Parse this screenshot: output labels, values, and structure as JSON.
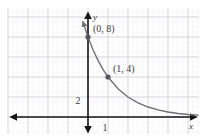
{
  "figure": {
    "name": "exponential-decay-graph",
    "background_color": "#ffffff",
    "grid": {
      "major_color": "#c8c8cf",
      "minor_color": "#e8e8ee",
      "major_spacing": 20,
      "minor_spacing": 5,
      "origin_x": 88,
      "origin_y": 117,
      "left": 8,
      "right": 199,
      "top": 8,
      "bottom": 134
    },
    "axes": {
      "color": "#161616",
      "x_axis_label": "x",
      "y_axis_label": "y",
      "x_axis_y": 117,
      "y_axis_x": 88,
      "arrowheads": "both"
    },
    "ticks": {
      "x": [
        {
          "label": "1",
          "value": 1
        }
      ],
      "y": [
        {
          "label": "2",
          "value": 2
        }
      ]
    },
    "curve": {
      "color": "#6e6e76",
      "width": 1.3,
      "arrow_at_top": true
    },
    "points": [
      {
        "label": "(0, 8)",
        "x": 0,
        "y": 8,
        "px": 88,
        "py": 57
      },
      {
        "label": "(1, 4)",
        "x": 1,
        "y": 4,
        "px": 108,
        "py": 87
      }
    ],
    "point_color": "#55555d"
  },
  "chart_data": {
    "type": "line",
    "title": "",
    "xlabel": "x",
    "ylabel": "y",
    "equation": "y = 8 * (1/2)^x",
    "grid": true,
    "legend": "none",
    "xlim": [
      -4,
      5.5
    ],
    "ylim": [
      -1,
      13
    ],
    "x_ticks": [
      "1"
    ],
    "y_ticks": [
      "2"
    ],
    "annotations": [
      "(0, 8)",
      "(1, 4)"
    ],
    "series": [
      {
        "name": "y = 8(1/2)^x",
        "x": [
          -0.75,
          -0.5,
          -0.25,
          0,
          0.25,
          0.5,
          0.75,
          1,
          1.5,
          2,
          2.5,
          3,
          3.5,
          4,
          4.5,
          5,
          5.5
        ],
        "values": [
          13.45,
          11.31,
          9.51,
          8,
          6.73,
          5.66,
          4.76,
          4,
          2.83,
          2,
          1.41,
          1,
          0.71,
          0.5,
          0.35,
          0.25,
          0.18
        ]
      }
    ],
    "points": [
      {
        "label": "(0, 8)",
        "x": 0,
        "y": 8
      },
      {
        "label": "(1, 4)",
        "x": 1,
        "y": 4
      }
    ]
  }
}
